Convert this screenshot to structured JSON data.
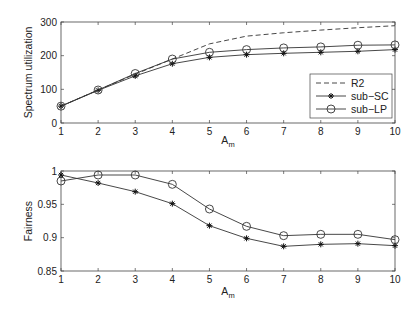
{
  "chart_data": [
    {
      "type": "line",
      "title": "",
      "xlabel": "A",
      "xlabel_sub": "m",
      "ylabel": "Spectrum utilization",
      "x": [
        1,
        2,
        3,
        4,
        5,
        6,
        7,
        8,
        9,
        10
      ],
      "xlim": [
        1,
        10
      ],
      "ylim": [
        0,
        300
      ],
      "xticks": [
        "1",
        "2",
        "3",
        "4",
        "5",
        "6",
        "7",
        "8",
        "9",
        "10"
      ],
      "yticks": [
        "0",
        "100",
        "200",
        "300"
      ],
      "ytick_values": [
        0,
        100,
        200,
        300
      ],
      "grid": false,
      "legend_position": "right-center",
      "series": [
        {
          "name": "R2",
          "style": "dashed",
          "marker": "none",
          "values": [
            50,
            98,
            145,
            190,
            235,
            258,
            268,
            276,
            283,
            289
          ]
        },
        {
          "name": "sub−SC",
          "style": "solid",
          "marker": "star",
          "values": [
            50,
            97,
            140,
            176,
            195,
            203,
            207,
            210,
            213,
            218
          ]
        },
        {
          "name": "sub−LP",
          "style": "solid",
          "marker": "circle",
          "values": [
            50,
            98,
            147,
            190,
            210,
            218,
            223,
            226,
            231,
            232
          ]
        }
      ]
    },
    {
      "type": "line",
      "title": "",
      "xlabel": "A",
      "xlabel_sub": "m",
      "ylabel": "Fairness",
      "x": [
        1,
        2,
        3,
        4,
        5,
        6,
        7,
        8,
        9,
        10
      ],
      "xlim": [
        1,
        10
      ],
      "ylim": [
        0.85,
        1
      ],
      "xticks": [
        "1",
        "2",
        "3",
        "4",
        "5",
        "6",
        "7",
        "8",
        "9",
        "10"
      ],
      "yticks": [
        "0.85",
        "0.9",
        "0.95",
        "1"
      ],
      "ytick_values": [
        0.85,
        0.9,
        0.95,
        1
      ],
      "grid": false,
      "series": [
        {
          "name": "sub−SC",
          "style": "solid",
          "marker": "star",
          "values": [
            0.994,
            0.982,
            0.969,
            0.951,
            0.918,
            0.899,
            0.887,
            0.89,
            0.891,
            0.888
          ]
        },
        {
          "name": "sub−LP",
          "style": "solid",
          "marker": "circle",
          "values": [
            0.985,
            0.994,
            0.994,
            0.98,
            0.943,
            0.917,
            0.903,
            0.905,
            0.905,
            0.897
          ]
        }
      ]
    }
  ],
  "colors": {
    "line": "#333333",
    "axis": "#444444",
    "text": "#222222"
  }
}
